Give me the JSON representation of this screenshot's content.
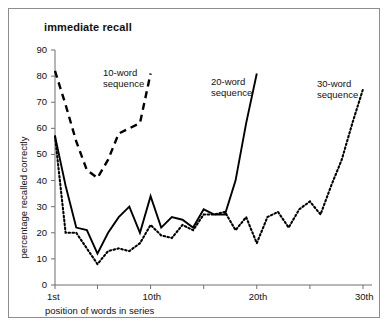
{
  "chart_data": {
    "type": "line",
    "title": "immediate recall",
    "xlabel": "position of words in series",
    "ylabel": "percentage recalled correctly",
    "xlim": [
      1,
      30
    ],
    "ylim": [
      0,
      90
    ],
    "grid": false,
    "legend_position": "inline-annotations",
    "yticks": [
      0,
      10,
      20,
      30,
      40,
      50,
      60,
      70,
      80,
      90
    ],
    "xticks": [
      1,
      10,
      20,
      30
    ],
    "xticklabels": [
      "1st",
      "10th",
      "20th",
      "30th"
    ],
    "series": [
      {
        "name": "10-word sequence",
        "style": "dashed",
        "color": "#000000",
        "x": [
          1,
          2,
          3,
          4,
          5,
          6,
          7,
          8,
          9,
          10
        ],
        "values": [
          82,
          69,
          55,
          44,
          41,
          48,
          58,
          60,
          62,
          81
        ]
      },
      {
        "name": "20-word sequence",
        "style": "solid",
        "color": "#000000",
        "x": [
          1,
          2,
          3,
          4,
          5,
          6,
          7,
          8,
          9,
          10,
          11,
          12,
          13,
          14,
          15,
          16,
          17,
          18,
          19,
          20
        ],
        "values": [
          57,
          38,
          22,
          21,
          12,
          20,
          26,
          30,
          20,
          34,
          22,
          26,
          25,
          22,
          29,
          27,
          27,
          40,
          62,
          81
        ]
      },
      {
        "name": "30-word sequence",
        "style": "dotted",
        "color": "#000000",
        "x": [
          1,
          2,
          3,
          4,
          5,
          6,
          7,
          8,
          9,
          10,
          11,
          12,
          13,
          14,
          15,
          16,
          17,
          18,
          19,
          20,
          21,
          22,
          23,
          24,
          25,
          26,
          27,
          28,
          29,
          30
        ],
        "values": [
          57,
          20,
          20,
          14,
          8,
          13,
          14,
          13,
          16,
          23,
          19,
          18,
          23,
          21,
          27,
          27,
          28,
          21,
          26,
          16,
          26,
          28,
          22,
          29,
          32,
          27,
          38,
          48,
          62,
          75
        ]
      }
    ],
    "annotations": [
      {
        "text_line1": "10-word",
        "text_line2": "sequence",
        "x_px": 103,
        "y_px": 67
      },
      {
        "text_line1": "20-word",
        "text_line2": "sequence",
        "x_px": 211,
        "y_px": 76
      },
      {
        "text_line1": "30-word",
        "text_line2": "sequence",
        "x_px": 317,
        "y_px": 78
      }
    ]
  }
}
